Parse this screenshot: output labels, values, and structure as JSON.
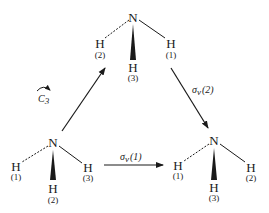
{
  "molecules": [
    {
      "id": "top",
      "center": "N",
      "hydrogens": [
        {
          "atom": "H",
          "index": "(2)",
          "bond": "dashed"
        },
        {
          "atom": "H",
          "index": "(1)",
          "bond": "solid"
        },
        {
          "atom": "H",
          "index": "(3)",
          "bond": "wedge"
        }
      ]
    },
    {
      "id": "bottom-left",
      "center": "N",
      "hydrogens": [
        {
          "atom": "H",
          "index": "(1)",
          "bond": "dashed"
        },
        {
          "atom": "H",
          "index": "(3)",
          "bond": "solid"
        },
        {
          "atom": "H",
          "index": "(2)",
          "bond": "wedge"
        }
      ]
    },
    {
      "id": "bottom-right",
      "center": "N",
      "hydrogens": [
        {
          "atom": "H",
          "index": "(1)",
          "bond": "dashed"
        },
        {
          "atom": "H",
          "index": "(2)",
          "bond": "solid"
        },
        {
          "atom": "H",
          "index": "(3)",
          "bond": "wedge"
        }
      ]
    }
  ],
  "operations": {
    "c3": {
      "symbol": "C",
      "subscript": "3"
    },
    "sigma_v2": {
      "symbol": "σ",
      "subscript": "v",
      "index": "(2)"
    },
    "sigma_v1": {
      "symbol": "σ",
      "subscript": "v",
      "index": "(1)"
    }
  }
}
